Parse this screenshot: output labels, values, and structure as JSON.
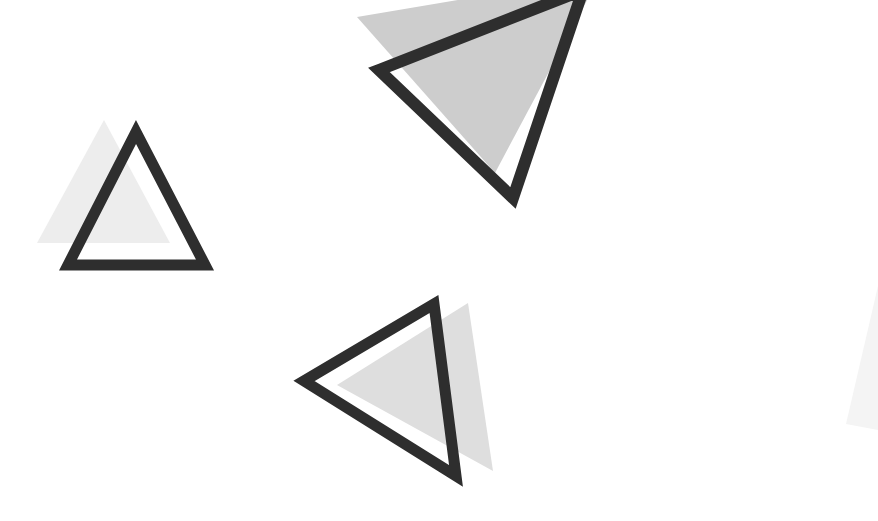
{
  "canvas": {
    "width": 878,
    "height": 521,
    "background_color": "#ffffff",
    "description": "Abstract white background with three outlined dark triangles each paired with an offset light-gray filled triangle, plus a faint gray wedge at the right edge"
  },
  "palette": {
    "background": "#ffffff",
    "stroke_dark": "#2e2e2e",
    "gray_light": "#eeeeee",
    "gray_mid": "#cdcdcd",
    "gray_soft": "#dedede",
    "gray_faint": "#f4f4f4"
  },
  "shapes": [
    {
      "id": "small-triangle-gray",
      "kind": "filled-triangle",
      "label": "Small upward gray triangle",
      "fill": "#ededed",
      "points": "104,120 170,243 37,243"
    },
    {
      "id": "small-triangle-outline",
      "kind": "outlined-triangle",
      "label": "Small upward dark outlined triangle",
      "stroke": "#2e2e2e",
      "stroke_width": 11,
      "points": "136,132 205,265 68,265"
    },
    {
      "id": "top-triangle-gray",
      "kind": "filled-triangle",
      "label": "Top rotated gray triangle",
      "fill": "#cdcdcd",
      "points": "357,17 600,-24 495,173"
    },
    {
      "id": "top-triangle-outline",
      "kind": "outlined-triangle",
      "label": "Top rotated dark outlined triangle",
      "stroke": "#2e2e2e",
      "stroke_width": 12,
      "points": "379,70 583,-10 513,198"
    },
    {
      "id": "bottom-triangle-gray",
      "kind": "filled-triangle",
      "label": "Bottom-left rotated gray triangle",
      "fill": "#dedede",
      "points": "468,303 493,471 337,385"
    },
    {
      "id": "bottom-triangle-outline",
      "kind": "outlined-triangle",
      "label": "Bottom-left dark outlined triangle pointing left",
      "stroke": "#2e2e2e",
      "stroke_width": 11,
      "points": "434,304 456,476 304,381"
    },
    {
      "id": "edge-wedge-gray",
      "kind": "filled-triangle",
      "label": "Faint gray wedge at right edge",
      "fill": "#f4f4f4",
      "points": "878,286 878,430 846,424"
    }
  ]
}
